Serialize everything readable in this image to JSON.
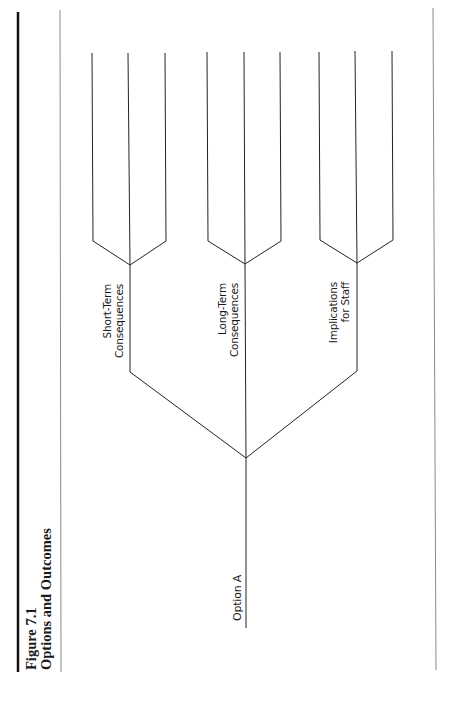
{
  "figure": {
    "number_label": "Figure 7.1",
    "title": "Options and Outcomes"
  },
  "tree": {
    "root": {
      "label": "Option A"
    },
    "branches": [
      {
        "label_line1": "Short-Term",
        "label_line2": "Consequences",
        "leaf_count": 3
      },
      {
        "label_line1": "Long-Term",
        "label_line2": "Consequences",
        "leaf_count": 3
      },
      {
        "label_line1": "Implications",
        "label_line2": "for Staff",
        "leaf_count": 3
      }
    ]
  },
  "colors": {
    "line": "#222222",
    "rule_thin": "#888888",
    "rule_thick": "#111111",
    "background": "#ffffff"
  }
}
